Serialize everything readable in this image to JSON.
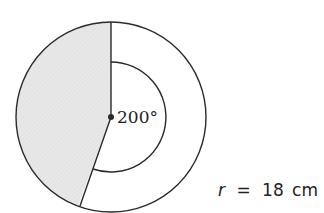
{
  "diagram": {
    "type": "circle-sector",
    "angle_label": "200°",
    "radius_label": {
      "variable": "r",
      "equals": "=",
      "value": "18",
      "unit": "cm"
    },
    "sector_angle_degrees": 200,
    "shaded_region": "minor-sector",
    "colors": {
      "stroke": "#2a2a2a",
      "shaded_fill": "#e6e6e6",
      "background": "#ffffff"
    }
  }
}
